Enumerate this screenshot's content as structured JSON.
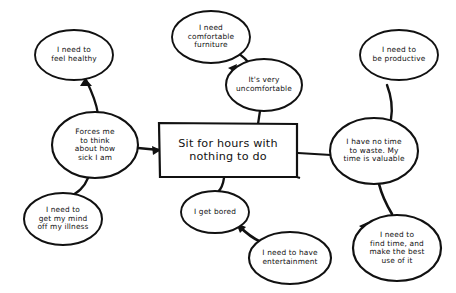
{
  "diagram": {
    "type": "mind-map",
    "title_node": {
      "id": "center",
      "shape": "rectangle",
      "text": "Sit for hours with\nnothing to do",
      "cx": 228,
      "cy": 150,
      "w": 138,
      "h": 54
    },
    "stroke_color": "#111111",
    "background_color": "#ffffff",
    "nodes": [
      {
        "id": "feel-healthy",
        "shape": "ellipse",
        "text": "I need to\nfeel healthy",
        "cx": 74,
        "cy": 55,
        "rx": 39,
        "ry": 25
      },
      {
        "id": "forces-me-to-think",
        "shape": "ellipse",
        "text": "Forces me\nto think\nabout how\nsick I am",
        "cx": 95,
        "cy": 145,
        "rx": 43,
        "ry": 33
      },
      {
        "id": "get-my-mind-off",
        "shape": "ellipse",
        "text": "I need to\nget my mind\noff my illness",
        "cx": 63,
        "cy": 219,
        "rx": 39,
        "ry": 26
      },
      {
        "id": "comfortable-furniture",
        "shape": "ellipse",
        "text": "I need\ncomfortable\nfurniture",
        "cx": 211,
        "cy": 37,
        "rx": 39,
        "ry": 26
      },
      {
        "id": "very-uncomfortable",
        "shape": "ellipse",
        "text": "It's very\nuncomfortable",
        "cx": 264,
        "cy": 85,
        "rx": 38,
        "ry": 26
      },
      {
        "id": "be-productive",
        "shape": "ellipse",
        "text": "I need to\nbe productive",
        "cx": 399,
        "cy": 55,
        "rx": 39,
        "ry": 25
      },
      {
        "id": "no-time-to-waste",
        "shape": "ellipse",
        "text": "I have no time\nto waste. My\ntime is valuable",
        "cx": 374,
        "cy": 151,
        "rx": 44,
        "ry": 33
      },
      {
        "id": "find-time-best-use",
        "shape": "ellipse",
        "text": "I need to\nfind time, and\nmake the best\nuse of it",
        "cx": 397,
        "cy": 248,
        "rx": 44,
        "ry": 33
      },
      {
        "id": "i-get-bored",
        "shape": "ellipse",
        "text": "I get bored",
        "cx": 215,
        "cy": 212,
        "rx": 34,
        "ry": 21
      },
      {
        "id": "need-entertainment",
        "shape": "ellipse",
        "text": "I need to have\nentertainment",
        "cx": 290,
        "cy": 258,
        "rx": 41,
        "ry": 26
      }
    ],
    "edges": [
      {
        "id": "edge-feel-healthy",
        "from": "forces-me-to-think",
        "to": "feel-healthy",
        "arrow": "to"
      },
      {
        "id": "edge-mind-off",
        "from": "forces-me-to-think",
        "to": "get-my-mind-off",
        "arrow": "to"
      },
      {
        "id": "edge-forces-center",
        "from": "forces-me-to-think",
        "to": "center",
        "arrow": "to"
      },
      {
        "id": "edge-furniture",
        "from": "very-uncomfortable",
        "to": "comfortable-furniture",
        "arrow": "to"
      },
      {
        "id": "edge-uncomfortable-center",
        "from": "very-uncomfortable",
        "to": "center",
        "arrow": "none"
      },
      {
        "id": "edge-productive",
        "from": "no-time-to-waste",
        "to": "be-productive",
        "arrow": "to"
      },
      {
        "id": "edge-center-notime",
        "from": "center",
        "to": "no-time-to-waste",
        "arrow": "none"
      },
      {
        "id": "edge-find-time",
        "from": "no-time-to-waste",
        "to": "find-time-best-use",
        "arrow": "to"
      },
      {
        "id": "edge-center-bored",
        "from": "center",
        "to": "i-get-bored",
        "arrow": "to"
      },
      {
        "id": "edge-bored-entertainment",
        "from": "need-entertainment",
        "to": "i-get-bored",
        "arrow": "to"
      }
    ]
  }
}
